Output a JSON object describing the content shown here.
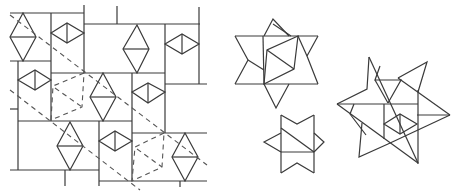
{
  "figure": {
    "line_color": "#3a3a3a",
    "dash_color": "#555555",
    "background": "#ffffff"
  },
  "panels": [
    {
      "name": "tiling-panel",
      "label": "rectangle tiling with rhombi and dashed fold lines"
    },
    {
      "name": "star-large-top",
      "label": "six-pointed star with inner triangles"
    },
    {
      "name": "star-small-bottom",
      "label": "small star with notched rectangle"
    },
    {
      "name": "star-large-right",
      "label": "six-pointed star with inner diamond"
    }
  ]
}
